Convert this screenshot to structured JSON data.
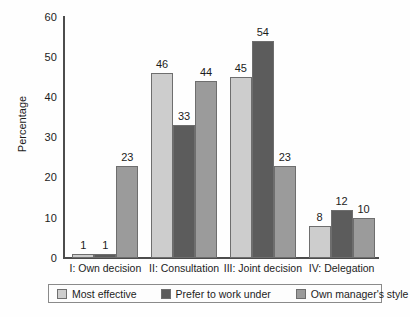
{
  "chart_data": {
    "type": "bar",
    "title": "",
    "xlabel": "",
    "ylabel": "Percentage",
    "ylim": [
      0,
      60
    ],
    "yticks": [
      0,
      10,
      20,
      30,
      40,
      50,
      60
    ],
    "grid": false,
    "legend_position": "bottom",
    "categories": [
      "I: Own decision",
      "II: Consultation",
      "III: Joint decision",
      "IV: Delegation"
    ],
    "series": [
      {
        "name": "Most effective",
        "color": "#cdcdcd",
        "values": [
          1,
          46,
          45,
          8
        ]
      },
      {
        "name": "Prefer to work under",
        "color": "#5c5c5c",
        "values": [
          1,
          33,
          54,
          12
        ]
      },
      {
        "name": "Own manager's style",
        "color": "#9b9b9b",
        "values": [
          23,
          44,
          23,
          10
        ]
      }
    ]
  },
  "axis": {
    "y_tick_labels": [
      "0",
      "10",
      "20",
      "30",
      "40",
      "50",
      "60"
    ],
    "y_axis_title": "Percentage"
  },
  "legend": {
    "entries": [
      {
        "label": "Most effective"
      },
      {
        "label": "Prefer to work under"
      },
      {
        "label": "Own manager's style"
      }
    ]
  },
  "colors": {
    "series_light": "#cdcdcd",
    "series_dark": "#5c5c5c",
    "series_medium": "#9b9b9b",
    "axis": "#4c4c4c",
    "text": "#1c1c1c"
  }
}
